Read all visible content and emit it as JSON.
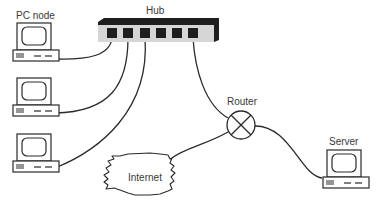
{
  "diagram": {
    "type": "network-topology",
    "nodes": [
      {
        "id": "hub",
        "label": "Hub",
        "ports": 6
      },
      {
        "id": "pc1",
        "label": "PC node"
      },
      {
        "id": "pc2",
        "label": ""
      },
      {
        "id": "pc3",
        "label": ""
      },
      {
        "id": "router",
        "label": "Router"
      },
      {
        "id": "server",
        "label": "Server"
      },
      {
        "id": "internet",
        "label": "Internet"
      }
    ],
    "edges": [
      {
        "from": "pc1",
        "to": "hub",
        "port": 1
      },
      {
        "from": "pc2",
        "to": "hub",
        "port": 2
      },
      {
        "from": "pc3",
        "to": "hub",
        "port": 3
      },
      {
        "from": "hub",
        "to": "router",
        "port": 6
      },
      {
        "from": "router",
        "to": "internet"
      },
      {
        "from": "router",
        "to": "server"
      }
    ]
  },
  "labels": {
    "hub": "Hub",
    "pc_node": "PC node",
    "router": "Router",
    "server": "Server",
    "internet": "Internet"
  },
  "colors": {
    "line": "#2a2a2a",
    "hub_body": "#d8d8d8",
    "hub_top": "#1e1e1e",
    "port": "#1e1e1e",
    "text": "#3a3a3a"
  }
}
